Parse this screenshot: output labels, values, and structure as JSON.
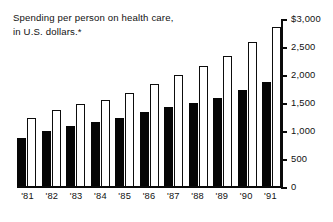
{
  "title": {
    "text": "Spending per person on health care,\nin U.S. dollars.*"
  },
  "axis": {
    "y_ticks": [
      {
        "label": "$3,000",
        "value": 3000
      },
      {
        "label": "2,500",
        "value": 2500
      },
      {
        "label": "2,000",
        "value": 2000
      },
      {
        "label": "1,500",
        "value": 1500
      },
      {
        "label": "1,000",
        "value": 1000
      },
      {
        "label": "500",
        "value": 500
      },
      {
        "label": "0",
        "value": 0
      }
    ]
  },
  "chart_data": {
    "type": "bar",
    "title": "Spending per person on health care, in U.S. dollars.*",
    "xlabel": "",
    "ylabel": "",
    "ylim": [
      0,
      3000
    ],
    "ytick_values": [
      0,
      500,
      1000,
      1500,
      2000,
      2500,
      3000
    ],
    "ytick_labels": [
      "0",
      "500",
      "1,000",
      "1,500",
      "2,000",
      "2,500",
      "$3,000"
    ],
    "grid": false,
    "legend": null,
    "axis_position": "right",
    "categories": [
      "'81",
      "'82",
      "'83",
      "'84",
      "'85",
      "'86",
      "'87",
      "'88",
      "'89",
      "'90",
      "'91"
    ],
    "series": [
      {
        "name": "dark-bar",
        "style": "filled-black",
        "values": [
          900,
          1025,
          1100,
          1175,
          1250,
          1350,
          1450,
          1525,
          1600,
          1750,
          1900
        ]
      },
      {
        "name": "light-bar",
        "style": "outlined-white",
        "values": [
          1250,
          1400,
          1500,
          1575,
          1700,
          1850,
          2025,
          2175,
          2350,
          2600,
          2875
        ]
      }
    ]
  },
  "colors": {
    "dark_bar": "#050505",
    "light_bar_fill": "#ffffff",
    "light_bar_stroke": "#0d0d0d",
    "axis": "#0a0a0a",
    "text": "#111111",
    "background": "#ffffff"
  }
}
